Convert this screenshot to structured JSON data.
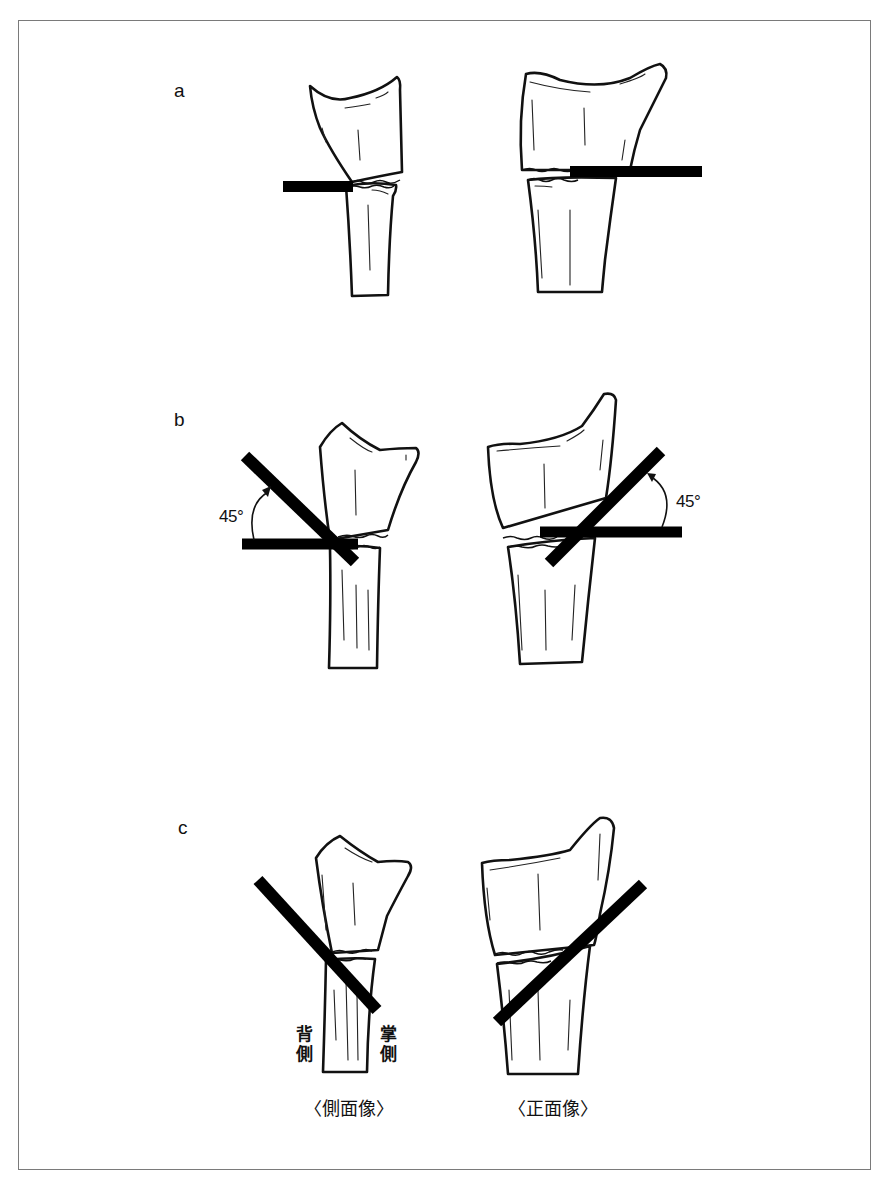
{
  "figure": {
    "border_color": "#7a7a7a",
    "ink_color": "#111111",
    "panels": [
      {
        "id": "a",
        "label": "a",
        "description": "Horizontal line at fracture site",
        "lateral_view": {
          "bar_angle_deg": 0
        },
        "ap_view": {
          "bar_angle_deg": 0
        }
      },
      {
        "id": "b",
        "label": "b",
        "description": "Line rotated 45 degrees from horizontal",
        "lateral_view": {
          "bar_angle_deg": 45,
          "angle_label": "45°"
        },
        "ap_view": {
          "bar_angle_deg": 45,
          "angle_label": "45°"
        }
      },
      {
        "id": "c",
        "label": "c",
        "description": "Oblique line only",
        "lateral_view": {
          "bar_angle_deg": 45,
          "side_labels": {
            "dorsal": "背側",
            "palmar": "掌側"
          }
        },
        "ap_view": {
          "bar_angle_deg": 45
        }
      }
    ],
    "captions": {
      "lateral": "〈側面像〉",
      "ap": "〈正面像〉"
    }
  }
}
